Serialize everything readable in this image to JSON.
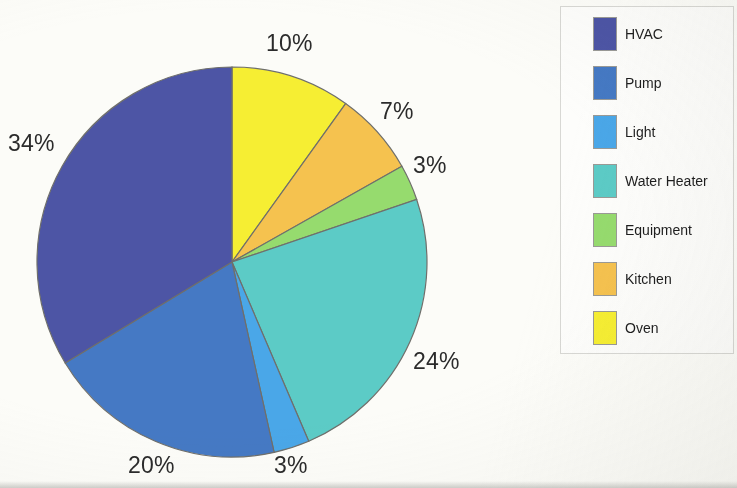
{
  "chart_data": {
    "type": "pie",
    "title": "",
    "labels": [
      "HVAC",
      "Pump",
      "Light",
      "Water Heater",
      "Equipment",
      "Kitchen",
      "Oven"
    ],
    "values": [
      34,
      20,
      3,
      24,
      3,
      7,
      10
    ],
    "value_labels": [
      "34%",
      "20%",
      "3%",
      "24%",
      "3%",
      "7%",
      "10%"
    ],
    "units": "percent",
    "colors": [
      "#4d55a5",
      "#4579c4",
      "#4aa7e8",
      "#5ccbc6",
      "#96db6e",
      "#f5c24f",
      "#f6ee33"
    ],
    "legend_position": "right",
    "grid": false,
    "start_angle_deg": 0,
    "direction": "clockwise",
    "slice_order_clockwise_from_top": [
      "Oven",
      "Kitchen",
      "Equipment",
      "Water Heater",
      "Light",
      "Pump",
      "HVAC"
    ]
  },
  "pie": {
    "center_x": 232,
    "center_y": 262,
    "radius": 195,
    "outline_color": "#6f6f6b",
    "labels": [
      {
        "text": "10%",
        "x": 266,
        "y": 30
      },
      {
        "text": "7%",
        "x": 380,
        "y": 98
      },
      {
        "text": "3%",
        "x": 413,
        "y": 152
      },
      {
        "text": "24%",
        "x": 413,
        "y": 348
      },
      {
        "text": "3%",
        "x": 274,
        "y": 452
      },
      {
        "text": "20%",
        "x": 128,
        "y": 452
      },
      {
        "text": "34%",
        "x": 8,
        "y": 130
      }
    ]
  },
  "legend": {
    "items": [
      {
        "label": "HVAC",
        "color": "#4d55a5",
        "top": 10
      },
      {
        "label": "Pump",
        "color": "#4579c4",
        "top": 59
      },
      {
        "label": "Light",
        "color": "#4aa7e8",
        "top": 108
      },
      {
        "label": "Water Heater",
        "color": "#5ccbc6",
        "top": 157
      },
      {
        "label": "Equipment",
        "color": "#96db6e",
        "top": 206
      },
      {
        "label": "Kitchen",
        "color": "#f5c24f",
        "top": 255
      },
      {
        "label": "Oven",
        "color": "#f6ee33",
        "top": 304
      }
    ]
  }
}
